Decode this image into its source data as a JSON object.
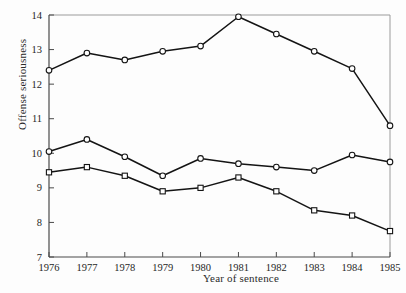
{
  "chart_data": {
    "type": "line",
    "title": "",
    "xlabel": "Year of sentence",
    "ylabel": "Offense seriousness",
    "categories": [
      "1976",
      "1977",
      "1978",
      "1979",
      "1980",
      "1981",
      "1982",
      "1983",
      "1984",
      "1985"
    ],
    "x": [
      1976,
      1977,
      1978,
      1979,
      1980,
      1981,
      1982,
      1983,
      1984,
      1985
    ],
    "xlim": [
      1976,
      1985
    ],
    "ylim": [
      7,
      14
    ],
    "yticks": [
      7,
      8,
      9,
      10,
      11,
      12,
      13,
      14
    ],
    "ytick_labels": [
      "7",
      "8",
      "9",
      "10",
      "11",
      "12",
      "13",
      "14"
    ],
    "xticks": [
      1976,
      1977,
      1978,
      1979,
      1980,
      1981,
      1982,
      1983,
      1984,
      1985
    ],
    "grid": false,
    "legend": "none",
    "series": [
      {
        "name": "upper",
        "marker": "circle",
        "color": "#141414",
        "values": [
          12.4,
          12.9,
          12.7,
          12.95,
          13.1,
          13.95,
          13.45,
          12.95,
          12.45,
          10.8
        ]
      },
      {
        "name": "middle",
        "marker": "circle",
        "color": "#141414",
        "values": [
          10.05,
          10.4,
          9.9,
          9.35,
          9.85,
          9.7,
          9.6,
          9.5,
          9.95,
          9.75
        ]
      },
      {
        "name": "lower",
        "marker": "square",
        "color": "#141414",
        "values": [
          9.45,
          9.6,
          9.35,
          8.9,
          9.0,
          9.3,
          8.9,
          8.35,
          8.2,
          7.75
        ]
      }
    ]
  },
  "axes": {
    "x_title": "Year of sentence",
    "y_title": "Offense seriousness"
  },
  "colors": {
    "line": "#141414",
    "frame": "#9b9b9b",
    "axis": "#4a4a4a",
    "text": "#262626",
    "background": "#fdfdfd"
  }
}
